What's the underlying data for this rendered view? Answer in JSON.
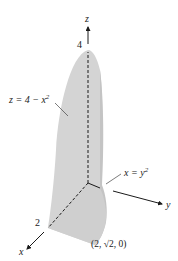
{
  "diagram": {
    "axes": {
      "z": {
        "label": "z",
        "tick_label": "4"
      },
      "x": {
        "label": "x",
        "tick_label": "2"
      },
      "y": {
        "label": "y"
      }
    },
    "surfaces": {
      "parabolic_cylinder": {
        "label": "z = 4 − x",
        "exponent": "2"
      },
      "parabolic_wall": {
        "label": "x = y",
        "exponent": "2"
      }
    },
    "point": {
      "label": "(2, √2, 0)"
    },
    "colors": {
      "surface_fill": "#d4d4d4",
      "surface_side": "#c4c4c4",
      "axis": "#1a1a1a",
      "background": "#ffffff"
    }
  }
}
